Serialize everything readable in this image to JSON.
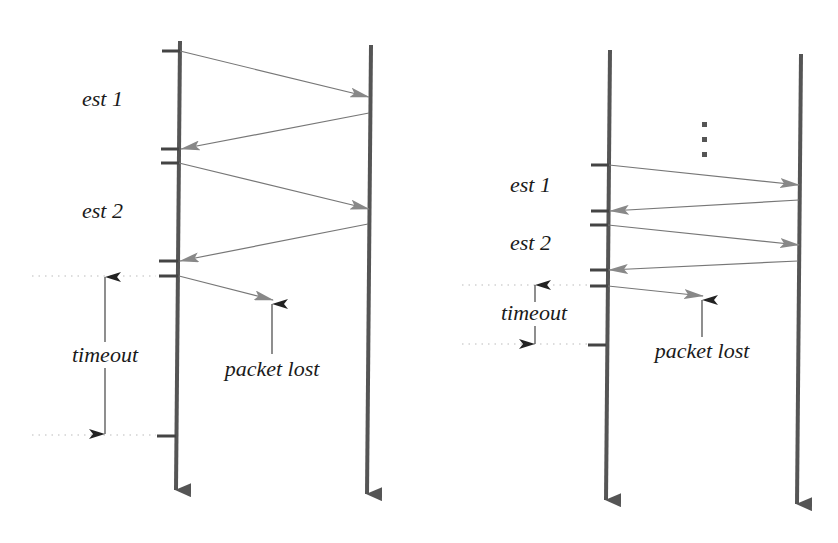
{
  "colors": {
    "timeline": "#555555",
    "tick": "#444444",
    "message": "#777777",
    "message_head": "#888888",
    "annotation_arrow": "#222222",
    "dotted": "#bbbbbb",
    "text": "#1a1a1a"
  },
  "diagrams": [
    {
      "name": "short-rtt-scenario",
      "sender_line": {
        "x1": 180,
        "y1": 41,
        "x2": 176,
        "y2": 502
      },
      "receiver_line": {
        "x1": 371,
        "y1": 45,
        "x2": 367,
        "y2": 506
      },
      "ticks": [
        {
          "x1": 162,
          "x2": 180,
          "y": 51
        },
        {
          "x1": 161,
          "x2": 179,
          "y": 149
        },
        {
          "x1": 161,
          "x2": 179,
          "y": 163
        },
        {
          "x1": 159,
          "x2": 178,
          "y": 261
        },
        {
          "x1": 159,
          "x2": 178,
          "y": 276
        },
        {
          "x1": 157,
          "x2": 176,
          "y": 436
        }
      ],
      "messages": [
        {
          "x1": 180,
          "y1": 51,
          "x2": 369,
          "y2": 97
        },
        {
          "x1": 369,
          "y1": 113,
          "x2": 181,
          "y2": 149
        },
        {
          "x1": 179,
          "y1": 163,
          "x2": 369,
          "y2": 209
        },
        {
          "x1": 368,
          "y1": 224,
          "x2": 180,
          "y2": 261
        },
        {
          "x1": 179,
          "y1": 276,
          "x2": 273,
          "y2": 300
        }
      ],
      "labels": [
        {
          "text": "est 1",
          "x": 82,
          "y": 106
        },
        {
          "text": "est 2",
          "x": 82,
          "y": 218
        },
        {
          "text": "timeout",
          "x": 105,
          "y": 362,
          "anchor": "middle"
        },
        {
          "text": "packet lost",
          "x": 272,
          "y": 376,
          "anchor": "middle"
        }
      ],
      "dotted_lines": [
        {
          "x1": 32,
          "x2": 156,
          "y": 276
        },
        {
          "x1": 32,
          "x2": 156,
          "y": 435
        }
      ],
      "timeout_arrow": {
        "x": 105,
        "top": 277,
        "bottom": 434,
        "gap_top": 342,
        "gap_bottom": 367
      },
      "lost_pointer": {
        "x": 272,
        "tip": 304,
        "base": 354
      }
    },
    {
      "name": "long-history-scenario",
      "sender_line": {
        "x1": 610,
        "y1": 50,
        "x2": 606,
        "y2": 512
      },
      "receiver_line": {
        "x1": 801,
        "y1": 54,
        "x2": 797,
        "y2": 516
      },
      "ticks": [
        {
          "x1": 591,
          "x2": 609,
          "y": 165
        },
        {
          "x1": 591,
          "x2": 609,
          "y": 211
        },
        {
          "x1": 590,
          "x2": 608,
          "y": 225
        },
        {
          "x1": 590,
          "x2": 608,
          "y": 270
        },
        {
          "x1": 590,
          "x2": 608,
          "y": 286
        },
        {
          "x1": 588,
          "x2": 606,
          "y": 345
        }
      ],
      "messages": [
        {
          "x1": 609,
          "y1": 165,
          "x2": 799,
          "y2": 185
        },
        {
          "x1": 799,
          "y1": 200,
          "x2": 610,
          "y2": 211
        },
        {
          "x1": 608,
          "y1": 225,
          "x2": 799,
          "y2": 245
        },
        {
          "x1": 798,
          "y1": 261,
          "x2": 609,
          "y2": 270
        },
        {
          "x1": 608,
          "y1": 286,
          "x2": 703,
          "y2": 296
        }
      ],
      "labels": [
        {
          "text": "est 1",
          "x": 510,
          "y": 192
        },
        {
          "text": "est 2",
          "x": 510,
          "y": 250
        },
        {
          "text": "timeout",
          "x": 534,
          "y": 320,
          "anchor": "middle"
        },
        {
          "text": "packet lost",
          "x": 702,
          "y": 358,
          "anchor": "middle"
        }
      ],
      "dotted_lines": [
        {
          "x1": 462,
          "x2": 587,
          "y": 285
        },
        {
          "x1": 462,
          "x2": 587,
          "y": 344
        }
      ],
      "timeout_arrow": {
        "x": 535,
        "top": 285,
        "bottom": 344,
        "gap_top": 302,
        "gap_bottom": 326
      },
      "lost_pointer": {
        "x": 702,
        "tip": 300,
        "base": 337
      },
      "ellipsis": {
        "x": 705,
        "ys": [
          125,
          140,
          155
        ]
      }
    }
  ],
  "text": {
    "left_est1": "est 1",
    "left_est2": "est 2",
    "left_timeout": "timeout",
    "left_packet_lost": "packet lost",
    "right_est1": "est 1",
    "right_est2": "est 2",
    "right_timeout": "timeout",
    "right_packet_lost": "packet lost"
  }
}
